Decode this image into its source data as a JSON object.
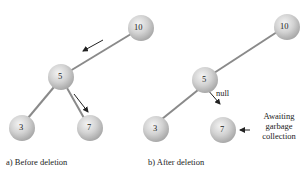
{
  "panels": [
    {
      "caption": "a) Before deletion",
      "nodes": [
        {
          "label": "10",
          "x": 141,
          "y": 28
        },
        {
          "label": "5",
          "x": 61,
          "y": 77
        },
        {
          "label": "3",
          "x": 22,
          "y": 128
        },
        {
          "label": "7",
          "x": 90,
          "y": 128
        }
      ]
    },
    {
      "caption": "b) After deletion",
      "nodes": [
        {
          "label": "10",
          "x": 287,
          "y": 27
        },
        {
          "label": "5",
          "x": 205,
          "y": 80
        },
        {
          "label": "3",
          "x": 156,
          "y": 129
        },
        {
          "label": "7",
          "x": 223,
          "y": 130
        }
      ],
      "null_label": "null",
      "annotation": [
        "Awaiting",
        "garbage",
        "collection"
      ]
    }
  ]
}
